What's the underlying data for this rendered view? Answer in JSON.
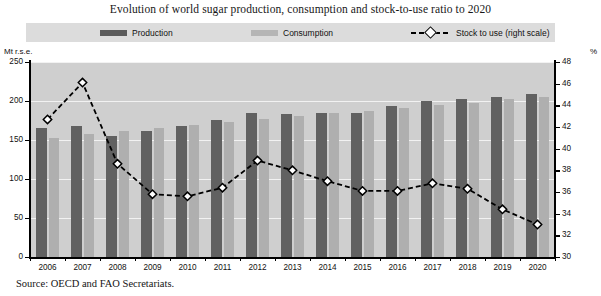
{
  "chart_data": {
    "type": "bar",
    "title": "Evolution of world sugar production, consumption and stock-to-use ratio to 2020",
    "xlabel": "",
    "ylabel": "Mt r.s.e.",
    "y2label": "%",
    "ylim": [
      0,
      250
    ],
    "y2lim": [
      30,
      48
    ],
    "yticks": [
      0,
      50,
      100,
      150,
      200,
      250
    ],
    "y2ticks": [
      30,
      32,
      34,
      36,
      38,
      40,
      42,
      44,
      46,
      48
    ],
    "grid": true,
    "legend_position": "top",
    "categories": [
      "2006",
      "2007",
      "2008",
      "2009",
      "2010",
      "2011",
      "2012",
      "2013",
      "2014",
      "2015",
      "2016",
      "2017",
      "2018",
      "2019",
      "2020"
    ],
    "series": [
      {
        "name": "Production",
        "type": "bar",
        "color": "#616161",
        "axis": "left",
        "values": [
          165,
          168,
          155,
          162,
          168,
          176,
          185,
          183,
          184,
          184,
          194,
          200,
          202,
          205,
          209
        ]
      },
      {
        "name": "Consumption",
        "type": "bar",
        "color": "#afafaf",
        "axis": "left",
        "values": [
          152,
          158,
          162,
          165,
          169,
          173,
          177,
          181,
          184,
          187,
          191,
          195,
          198,
          202,
          205
        ]
      },
      {
        "name": "Stock to use (right scale)",
        "type": "line",
        "color": "#000000",
        "axis": "right",
        "marker": "diamond",
        "dash": true,
        "values": [
          42.7,
          46.1,
          38.6,
          35.8,
          35.6,
          36.4,
          38.9,
          38.0,
          37.0,
          36.1,
          36.1,
          36.8,
          36.3,
          34.4,
          33.0
        ]
      }
    ],
    "source": "Source:  OECD and FAO Secretariats."
  },
  "legend": {
    "items": [
      {
        "label": "Production",
        "swatch": "production"
      },
      {
        "label": "Consumption",
        "swatch": "consumption"
      },
      {
        "label": "Stock to use (right scale)",
        "swatch": "line"
      }
    ]
  },
  "axis": {
    "left_caption": "Mt r.s.e.",
    "right_caption": "%"
  }
}
